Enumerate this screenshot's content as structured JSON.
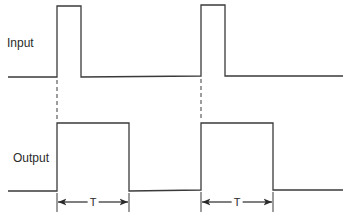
{
  "labels": {
    "input": "Input",
    "output": "Output",
    "period": "T"
  },
  "style": {
    "line_color": "#3a3a3a",
    "background": "#ffffff"
  },
  "waveforms": {
    "input": {
      "baseline_y": 77,
      "high_y": 6,
      "pulses": [
        {
          "start_x": 57,
          "end_x": 81
        },
        {
          "start_x": 201,
          "end_x": 225
        }
      ],
      "x_range": [
        8,
        343
      ]
    },
    "output": {
      "baseline_y": 190,
      "high_y": 123,
      "pulses": [
        {
          "start_x": 57,
          "end_x": 129
        },
        {
          "start_x": 201,
          "end_x": 273
        }
      ],
      "x_range": [
        8,
        343
      ]
    }
  },
  "dimension_markers": [
    {
      "from_x": 57,
      "to_x": 129,
      "y": 202,
      "label": "T"
    },
    {
      "from_x": 201,
      "to_x": 273,
      "y": 202,
      "label": "T"
    }
  ]
}
